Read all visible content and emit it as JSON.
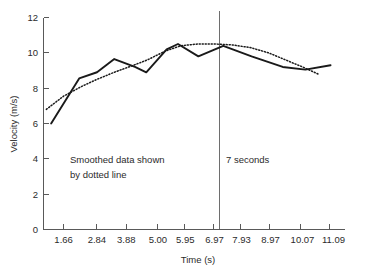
{
  "chart_data": {
    "type": "line",
    "title": "",
    "xlabel": "Time (s)",
    "ylabel": "Velocity (m/s)",
    "xlim": [
      0.95,
      11.6
    ],
    "ylim": [
      0,
      12
    ],
    "grid": false,
    "legend_position": "none",
    "x_tick_labels": [
      "1.66",
      "2.84",
      "3.88",
      "5.00",
      "5.95",
      "6.97",
      "7.93",
      "8.97",
      "10.07",
      "11.09"
    ],
    "x_tick_values": [
      1.66,
      2.84,
      3.88,
      5.0,
      5.95,
      6.97,
      7.93,
      8.97,
      10.07,
      11.09
    ],
    "y_tick_labels": [
      "0",
      "2",
      "4",
      "6",
      "8",
      "10",
      "12"
    ],
    "y_tick_values": [
      0,
      2,
      4,
      6,
      8,
      10,
      12
    ],
    "series": [
      {
        "name": "Raw data (solid line)",
        "style": "solid",
        "color": "#1a1a1a",
        "x": [
          1.22,
          2.21,
          2.84,
          3.45,
          4.18,
          4.58,
          5.3,
          5.7,
          6.42,
          7.3,
          8.3,
          9.4,
          10.2,
          11.09
        ],
        "y": [
          6.0,
          8.55,
          8.9,
          9.65,
          9.2,
          8.9,
          10.2,
          10.5,
          9.8,
          10.4,
          9.8,
          9.2,
          9.05,
          9.3
        ]
      },
      {
        "name": "Smoothed data (dotted line)",
        "style": "dotted",
        "color": "#1a1a1a",
        "x": [
          1.05,
          1.66,
          2.3,
          2.84,
          3.45,
          4.05,
          4.62,
          5.25,
          5.8,
          6.4,
          7.0,
          7.6,
          8.25,
          8.9,
          9.5,
          10.1,
          10.65
        ],
        "y": [
          6.8,
          7.55,
          8.1,
          8.5,
          8.9,
          9.25,
          9.6,
          10.1,
          10.4,
          10.5,
          10.5,
          10.45,
          10.3,
          10.0,
          9.6,
          9.2,
          8.8
        ]
      }
    ],
    "annotations": [
      {
        "name": "smoothed-note",
        "lines": [
          "Smoothed data shown",
          "by dotted line"
        ],
        "x": 2.2,
        "y": 4.0
      },
      {
        "name": "seven-seconds-note",
        "lines": [
          "7 seconds"
        ],
        "x": 7.1,
        "y": 4.0
      }
    ],
    "marker_lines": [
      {
        "name": "7-second-marker",
        "orientation": "vertical",
        "value": 6.97,
        "label": "7 seconds",
        "color": "#6e6e6e"
      }
    ]
  }
}
